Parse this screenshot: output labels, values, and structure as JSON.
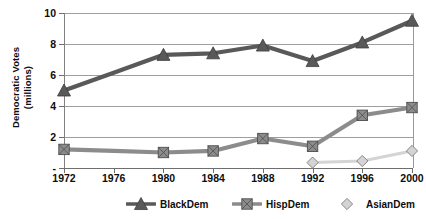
{
  "chart_data": {
    "type": "line",
    "title": "",
    "xlabel": "",
    "ylabel": "Democratic Votes (millions)",
    "ylabel_line1": "Democratic Votes",
    "ylabel_line2": "(millions)",
    "categories": [
      "1972",
      "1976",
      "1980",
      "1984",
      "1988",
      "1992",
      "1996",
      "2000"
    ],
    "ylim": [
      0,
      10
    ],
    "yticks": [
      0,
      2,
      4,
      6,
      8,
      10
    ],
    "ytick_labels": [
      "-",
      "2",
      "4",
      "6",
      "8",
      "10"
    ],
    "grid": true,
    "legend_position": "bottom",
    "series": [
      {
        "name": "BlackDem",
        "color": "#595959",
        "marker": "triangle",
        "values": [
          5.0,
          null,
          7.3,
          7.4,
          7.9,
          6.9,
          8.1,
          9.5
        ]
      },
      {
        "name": "HispDem",
        "color": "#8c8c8c",
        "marker": "square",
        "values": [
          1.2,
          null,
          1.0,
          1.1,
          1.9,
          1.4,
          3.4,
          3.9
        ]
      },
      {
        "name": "AsianDem",
        "color": "#d4d4d4",
        "marker": "diamond",
        "values": [
          null,
          null,
          null,
          null,
          null,
          0.35,
          0.45,
          1.1
        ]
      }
    ]
  },
  "legend": {
    "items": [
      {
        "label": "BlackDem"
      },
      {
        "label": "HispDem"
      },
      {
        "label": "AsianDem"
      }
    ]
  },
  "colors": {
    "background": "#ffffff",
    "axis": "#6e6e6e",
    "gridline": "#9e9e9e",
    "text": "#0d0d0d",
    "black_dem": "#595959",
    "hisp_dem": "#8c8c8c",
    "asian_dem": "#d4d4d4"
  }
}
